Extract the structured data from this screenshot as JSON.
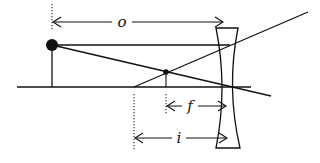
{
  "diagram": {
    "type": "ray-diagram",
    "colors": {
      "ink": "#111111",
      "background": "#ffffff"
    },
    "labels": {
      "object_distance": "o",
      "focal_length": "f",
      "image_distance": "i"
    },
    "elements": {
      "object": {
        "label": "object",
        "x": 52,
        "top_y": 45,
        "base_y": 87
      },
      "image": {
        "label": "virtual image",
        "x": 166,
        "top_y": 72,
        "base_y": 87
      },
      "lens": {
        "kind": "concave",
        "center_x": 227,
        "top_y": 28,
        "bottom_y": 148
      },
      "optical_axis": {
        "x1": 17,
        "x2": 251,
        "y": 87
      },
      "focal_point_marker_x": 134
    }
  }
}
